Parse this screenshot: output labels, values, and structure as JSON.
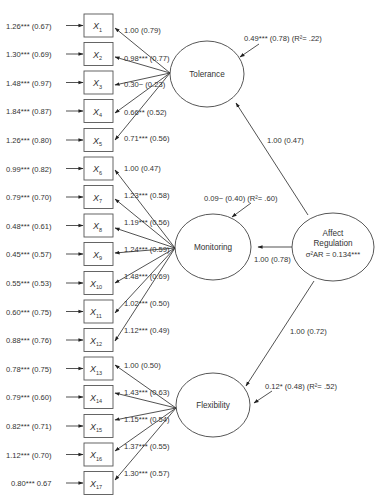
{
  "diagram": {
    "type": "structural-equation-model",
    "colors": {
      "line": "#333333",
      "box_border": "#555555",
      "text": "#333333",
      "background": "#ffffff"
    },
    "latents": {
      "tolerance": {
        "label": "Tolerance",
        "disturbance": "0.49*** (0.78) (R²= .22)"
      },
      "monitoring": {
        "label": "Monitoring",
        "disturbance": "0.09~  (0.40) (R²= .60)"
      },
      "flexibility": {
        "label": "Flexibility",
        "disturbance": "0.12* (0.48) (R²= .52)"
      },
      "affect_regulation": {
        "label_line1": "Affect",
        "label_line2": "Regulation",
        "variance": "σ²AR = 0.134***"
      }
    },
    "structural_paths": {
      "to_tolerance": "1.00 (0.47)",
      "to_monitoring": "1.00 (0.78)",
      "to_flexibility": "1.00 (0.72)"
    },
    "indicators": [
      {
        "name": "X",
        "sub": "1",
        "error": "1.26*** (0.67)",
        "loading": "1.00 (0.79)",
        "factor": "Tolerance"
      },
      {
        "name": "X",
        "sub": "2",
        "error": "1.30*** (0.69)",
        "loading": "0.98*** (0.77)",
        "factor": "Tolerance"
      },
      {
        "name": "X",
        "sub": "3",
        "error": "1.48*** (0.97)",
        "loading": "0.30~ (0.23)",
        "factor": "Tolerance"
      },
      {
        "name": "X",
        "sub": "4",
        "error": "1.84*** (0.87)",
        "loading": "0.66** (0.52)",
        "factor": "Tolerance"
      },
      {
        "name": "X",
        "sub": "5",
        "error": "1.26*** (0.80)",
        "loading": "0.71*** (0.56)",
        "factor": "Tolerance"
      },
      {
        "name": "X",
        "sub": "6",
        "error": "0.99*** (0.82)",
        "loading": "1.00 (0.47)",
        "factor": "Monitoring"
      },
      {
        "name": "X",
        "sub": "7",
        "error": "0.79*** (0.70)",
        "loading": "1.23*** (0.58)",
        "factor": "Monitoring"
      },
      {
        "name": "X",
        "sub": "8",
        "error": "0.48*** (0.61)",
        "loading": "1.19*** (0.56)",
        "factor": "Monitoring"
      },
      {
        "name": "X",
        "sub": "9",
        "error": "0.45*** (0.57)",
        "loading": "1.24*** (0.59)",
        "factor": "Monitoring"
      },
      {
        "name": "X",
        "sub": "10",
        "error": "0.55*** (0.53)",
        "loading": "1.48*** (0.69)",
        "factor": "Monitoring"
      },
      {
        "name": "X",
        "sub": "11",
        "error": "0.60*** (0.75)",
        "loading": "1.02*** (0.50)",
        "factor": "Monitoring"
      },
      {
        "name": "X",
        "sub": "12",
        "error": "0.88*** (0.76)",
        "loading": "1.12*** (0.49)",
        "factor": "Monitoring"
      },
      {
        "name": "X",
        "sub": "13",
        "error": "0.78*** (0.75)",
        "loading": "1.00 (0.50)",
        "factor": "Flexibility"
      },
      {
        "name": "X",
        "sub": "14",
        "error": "0.79*** (0.60)",
        "loading": "1.43*** (0.63)",
        "factor": "Flexibility"
      },
      {
        "name": "X",
        "sub": "15",
        "error": "0.82*** (0.71)",
        "loading": "1.15*** (0.54)",
        "factor": "Flexibility"
      },
      {
        "name": "X",
        "sub": "16",
        "error": "1.12*** (0.70)",
        "loading": "1.37*** (0.55)",
        "factor": "Flexibility"
      },
      {
        "name": "X",
        "sub": "17",
        "error": "0.80*** 0.67",
        "loading": "1.30*** (0.57)",
        "factor": "Flexibility"
      }
    ]
  }
}
